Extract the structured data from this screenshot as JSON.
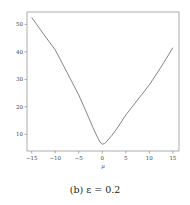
{
  "chart_data": {
    "type": "line",
    "title": "",
    "xlabel": "μ",
    "ylabel": "",
    "xlim": [
      -16,
      16.3
    ],
    "ylim": [
      3.9,
      54.5
    ],
    "xticks": [
      -15,
      -10,
      -5,
      0,
      5,
      10,
      15
    ],
    "yticks": [
      10,
      20,
      30,
      40,
      50
    ],
    "grid": false,
    "legend": null,
    "series": [
      {
        "name": "objective",
        "color": "#777777",
        "x": [
          -15,
          -12.5,
          -10,
          -7.5,
          -5,
          -3,
          -2,
          -1,
          -0.5,
          0,
          0.5,
          1,
          2,
          3,
          5,
          7.5,
          10,
          12.5,
          15
        ],
        "y": [
          52.5,
          46.5,
          40.7,
          32.5,
          24.3,
          16.5,
          12.5,
          8.8,
          7.2,
          6.4,
          6.6,
          7.5,
          9.5,
          11.8,
          17,
          22.5,
          28,
          34.5,
          41.5
        ]
      }
    ]
  },
  "caption": {
    "label": "(b) ε = 0.2"
  }
}
